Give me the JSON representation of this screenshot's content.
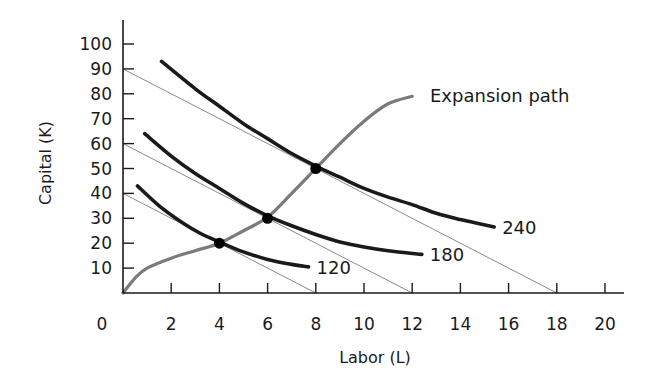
{
  "chart_data": {
    "type": "line",
    "title": "",
    "xlabel": "Labor (L)",
    "ylabel": "Capital (K)",
    "xlim": [
      0,
      20.8
    ],
    "ylim": [
      0,
      110
    ],
    "x_ticks": [
      2,
      4,
      6,
      8,
      10,
      12,
      14,
      16,
      18,
      20
    ],
    "y_ticks": [
      10,
      20,
      30,
      40,
      50,
      60,
      70,
      80,
      90,
      100
    ],
    "origin_label": "0",
    "grid": false,
    "isoquants": [
      {
        "name": "120",
        "label": "120",
        "points": [
          [
            0.6,
            43
          ],
          [
            1.5,
            35
          ],
          [
            2.5,
            28
          ],
          [
            3.2,
            24
          ],
          [
            4,
            20.5
          ],
          [
            5,
            16.5
          ],
          [
            6,
            13.5
          ],
          [
            7,
            11.5
          ],
          [
            7.7,
            10.5
          ]
        ]
      },
      {
        "name": "180",
        "label": "180",
        "points": [
          [
            0.9,
            64
          ],
          [
            2,
            55
          ],
          [
            3,
            48
          ],
          [
            4,
            42
          ],
          [
            5,
            36
          ],
          [
            6,
            31
          ],
          [
            7,
            27
          ],
          [
            8,
            23.5
          ],
          [
            9,
            20.5
          ],
          [
            10,
            18.5
          ],
          [
            11,
            17
          ],
          [
            12.4,
            15.5
          ]
        ]
      },
      {
        "name": "240",
        "label": "240",
        "points": [
          [
            1.6,
            93
          ],
          [
            3,
            82
          ],
          [
            4,
            75
          ],
          [
            5,
            68
          ],
          [
            6,
            62
          ],
          [
            7,
            56
          ],
          [
            8,
            51
          ],
          [
            9,
            46.5
          ],
          [
            10,
            42
          ],
          [
            11,
            38.5
          ],
          [
            12,
            35.5
          ],
          [
            13,
            32
          ],
          [
            14,
            29.5
          ],
          [
            15.4,
            26.5
          ]
        ]
      }
    ],
    "isocost_lines": [
      {
        "name": "isocost-low",
        "k_intercept": 40,
        "l_intercept": 8
      },
      {
        "name": "isocost-mid",
        "k_intercept": 60,
        "l_intercept": 12
      },
      {
        "name": "isocost-high",
        "k_intercept": 90,
        "l_intercept": 18
      }
    ],
    "expansion_path": {
      "label": "Expansion path",
      "points": [
        [
          0,
          0
        ],
        [
          0.5,
          6
        ],
        [
          1,
          10
        ],
        [
          2,
          14
        ],
        [
          3,
          17
        ],
        [
          4,
          20
        ],
        [
          5,
          25
        ],
        [
          6,
          30.5
        ],
        [
          7,
          40
        ],
        [
          8,
          50
        ],
        [
          9,
          60
        ],
        [
          10,
          69
        ],
        [
          11,
          76
        ],
        [
          12,
          79
        ]
      ]
    },
    "tangency_points": [
      [
        4,
        20
      ],
      [
        6,
        30
      ],
      [
        8,
        50
      ]
    ],
    "colors": {
      "isoquant": "#1a1a1a",
      "isocost": "#8a8a8a",
      "expansion_path": "#7a7a7a",
      "axis": "#1a1a1a",
      "point": "#000000"
    }
  }
}
